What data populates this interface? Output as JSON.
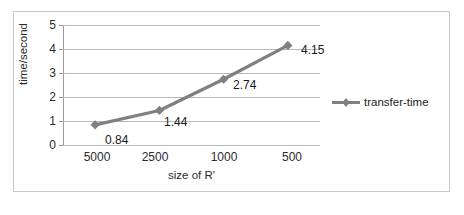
{
  "chart_data": {
    "type": "line",
    "title": "",
    "xlabel": "size of R'",
    "ylabel": "time/second",
    "categories": [
      "5000",
      "2500",
      "1000",
      "500"
    ],
    "values": [
      0.84,
      1.44,
      2.74,
      4.15
    ],
    "point_labels": [
      "0.84",
      "1.44",
      "2.74",
      "4.15"
    ],
    "series": [
      {
        "name": "transfer-time",
        "values": [
          0.84,
          1.44,
          2.74,
          4.15
        ],
        "color": "#808080",
        "marker": "diamond"
      }
    ],
    "ylim": [
      0,
      5
    ],
    "y_ticks": [
      "5",
      "4",
      "3",
      "2",
      "1",
      "0"
    ],
    "grid": true,
    "legend_position": "right"
  },
  "legend": {
    "entries": [
      {
        "label": "transfer-time",
        "color": "#808080"
      }
    ]
  },
  "colors": {
    "series": "#808080",
    "gridline": "#b8b8b8",
    "axis": "#9a9a9a",
    "frame": "#c9c9c9",
    "text": "#2b2b2b",
    "background": "#ffffff"
  }
}
